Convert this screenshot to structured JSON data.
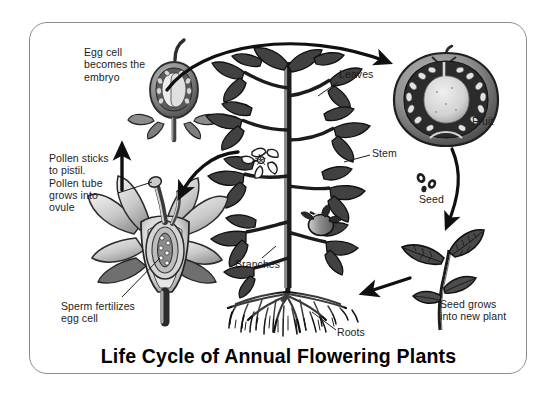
{
  "figure": {
    "title": "Life Cycle of Annual Flowering Plants",
    "frame_color": "#8d8d8d",
    "background_color": "#ffffff",
    "ink_color": "#1b1b1b"
  },
  "labels": {
    "egg_cell": "Egg cell\nbecomes the\nembryo",
    "pollen": "Pollen sticks\nto pistil.\nPollen tube\ngrows into\novule",
    "sperm": "Sperm fertilizes\negg cell",
    "leaves": "Leaves",
    "stem": "Stem",
    "branches": "Branches",
    "roots": "Roots",
    "fruit": "Fruit",
    "seed": "Seed",
    "new_plant": "Seed grows\ninto new plant"
  },
  "illustrations": {
    "embryo_fruit": "fruit-cross-section-with-embryo",
    "flower": "flower-cross-section-with-ovary",
    "plant": "tomato-plant-with-leaves-branches-roots",
    "ripe_fruit": "tomato-cross-section",
    "seeds": "seeds",
    "seedling": "young-seedling"
  },
  "arrows": [
    {
      "name": "embryo-to-fruit",
      "from": "embryo fruit",
      "to": "ripe fruit",
      "style": "curved"
    },
    {
      "name": "fruit-to-seed",
      "from": "ripe fruit",
      "to": "seedling",
      "style": "curved"
    },
    {
      "name": "seedling-to-plant",
      "from": "seedling",
      "to": "mature plant",
      "style": "straight"
    },
    {
      "name": "plant-to-flower",
      "from": "mature plant",
      "to": "flower",
      "style": "curved"
    },
    {
      "name": "flower-to-embryo",
      "from": "flower",
      "to": "embryo fruit",
      "style": "straight"
    }
  ]
}
